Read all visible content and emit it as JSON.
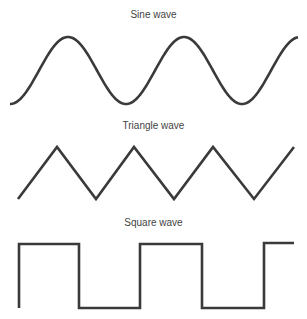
{
  "figure": {
    "panels": [
      {
        "title": "Sine wave",
        "type": "sine"
      },
      {
        "title": "Triangle wave",
        "type": "triangle"
      },
      {
        "title": "Square wave",
        "type": "square"
      }
    ]
  },
  "style": {
    "stroke_color": "#3a3a3a",
    "text_color": "#444444",
    "background": "#ffffff"
  },
  "geometry": {
    "sine": {
      "x_start": 10,
      "x_end": 298,
      "y_peak": 37,
      "y_trough": 104,
      "period_px": 116,
      "start_phase": "trough"
    },
    "triangle": {
      "points": [
        [
          18,
          199
        ],
        [
          57,
          147
        ],
        [
          96,
          199
        ],
        [
          134,
          147
        ],
        [
          174,
          199
        ],
        [
          213,
          147
        ],
        [
          254,
          199
        ],
        [
          294,
          147
        ]
      ]
    },
    "square": {
      "points": [
        [
          19,
          308
        ],
        [
          19,
          244
        ],
        [
          79,
          244
        ],
        [
          79,
          308
        ],
        [
          140,
          308
        ],
        [
          140,
          244
        ],
        [
          202,
          244
        ],
        [
          202,
          308
        ],
        [
          264,
          308
        ],
        [
          264,
          243
        ],
        [
          294,
          243
        ]
      ]
    }
  }
}
